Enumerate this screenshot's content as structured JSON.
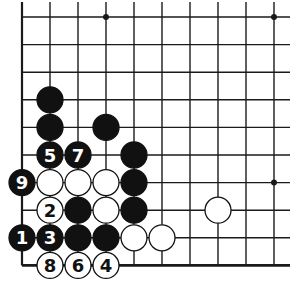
{
  "diagram": {
    "type": "go-board-fragment",
    "colors": {
      "line": "#1a1a1a",
      "black_stone": "#111111",
      "white_stone": "#ffffff",
      "background": "#ffffff"
    },
    "grid": {
      "x0": 22,
      "y0": 17,
      "dx": 28,
      "dy": 27.6,
      "cols": 10,
      "rows": 10,
      "left_edge": true,
      "bottom_edge": true,
      "right_extent": 290,
      "top_extent": 2
    },
    "star_points": [
      {
        "col": 3,
        "row": 0
      },
      {
        "col": 9,
        "row": 0
      },
      {
        "col": 9,
        "row": 6
      }
    ],
    "stones": [
      {
        "col": 1,
        "row": 3,
        "color": "black",
        "label": ""
      },
      {
        "col": 1,
        "row": 4,
        "color": "black",
        "label": ""
      },
      {
        "col": 3,
        "row": 4,
        "color": "black",
        "label": ""
      },
      {
        "col": 1,
        "row": 5,
        "color": "black",
        "label": "5"
      },
      {
        "col": 2,
        "row": 5,
        "color": "black",
        "label": "7"
      },
      {
        "col": 4,
        "row": 5,
        "color": "black",
        "label": ""
      },
      {
        "col": 0,
        "row": 6,
        "color": "black",
        "label": "9"
      },
      {
        "col": 1,
        "row": 6,
        "color": "white",
        "label": ""
      },
      {
        "col": 2,
        "row": 6,
        "color": "white",
        "label": ""
      },
      {
        "col": 3,
        "row": 6,
        "color": "white",
        "label": ""
      },
      {
        "col": 4,
        "row": 6,
        "color": "black",
        "label": ""
      },
      {
        "col": 1,
        "row": 7,
        "color": "white",
        "label": "2"
      },
      {
        "col": 2,
        "row": 7,
        "color": "black",
        "label": ""
      },
      {
        "col": 3,
        "row": 7,
        "color": "white",
        "label": ""
      },
      {
        "col": 4,
        "row": 7,
        "color": "black",
        "label": ""
      },
      {
        "col": 7,
        "row": 7,
        "color": "white",
        "label": ""
      },
      {
        "col": 0,
        "row": 8,
        "color": "black",
        "label": "1"
      },
      {
        "col": 1,
        "row": 8,
        "color": "black",
        "label": "3"
      },
      {
        "col": 2,
        "row": 8,
        "color": "black",
        "label": ""
      },
      {
        "col": 3,
        "row": 8,
        "color": "black",
        "label": ""
      },
      {
        "col": 4,
        "row": 8,
        "color": "white",
        "label": ""
      },
      {
        "col": 5,
        "row": 8,
        "color": "white",
        "label": ""
      },
      {
        "col": 1,
        "row": 9,
        "color": "white",
        "label": "8"
      },
      {
        "col": 2,
        "row": 9,
        "color": "white",
        "label": "6"
      },
      {
        "col": 3,
        "row": 9,
        "color": "white",
        "label": "4"
      }
    ],
    "move_sequence": [
      "1",
      "2",
      "3",
      "4",
      "5",
      "6",
      "7",
      "8",
      "9"
    ]
  }
}
